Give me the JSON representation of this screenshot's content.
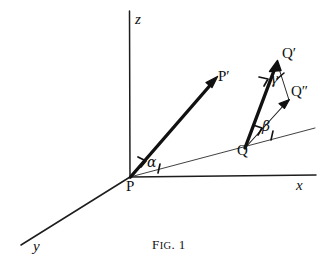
{
  "figure": {
    "caption_prefix": "F",
    "caption_smallcaps": "IG",
    "caption_suffix": ". 1",
    "caption_full": "Fig. 1",
    "background_color": "#ffffff",
    "ink_color": "#111111"
  },
  "axes": [
    {
      "id": "z",
      "label": "z",
      "from": [
        130,
        177
      ],
      "to": [
        129,
        11
      ],
      "weight": "thin"
    },
    {
      "id": "x",
      "label": "x",
      "from": [
        130,
        177
      ],
      "to": [
        316,
        175
      ],
      "weight": "thin"
    },
    {
      "id": "y",
      "label": "y",
      "from": [
        130,
        177
      ],
      "to": [
        21,
        245
      ],
      "weight": "thin"
    }
  ],
  "axis_labels": [
    {
      "id": "z-label",
      "text": "z",
      "x": 135,
      "y": 12
    },
    {
      "id": "x-label",
      "text": "x",
      "x": 296,
      "y": 180
    },
    {
      "id": "y-label",
      "text": "y",
      "x": 33,
      "y": 241
    }
  ],
  "points": [
    {
      "id": "P",
      "text": "P",
      "x": 127,
      "y": 179
    },
    {
      "id": "Pp",
      "text": "P′",
      "x": 219,
      "y": 70
    },
    {
      "id": "Q",
      "text": "Q",
      "x": 238,
      "y": 144
    },
    {
      "id": "Qp",
      "text": "Q′",
      "x": 283,
      "y": 47
    },
    {
      "id": "Qpp",
      "text": "Q″",
      "x": 292,
      "y": 85
    }
  ],
  "angles": [
    {
      "id": "alpha",
      "symbol": "α",
      "x": 148,
      "y": 157,
      "vertex": "P",
      "between": [
        "PP′",
        "ground-ray"
      ]
    },
    {
      "id": "beta",
      "symbol": "β",
      "x": 263,
      "y": 121,
      "vertex": "Q",
      "between": [
        "QQ″",
        "ground-ray"
      ]
    },
    {
      "id": "gamma",
      "symbol": "γ",
      "x": 272,
      "y": 74,
      "vertex": "Q′",
      "between": [
        "QQ′",
        "Q′Q″"
      ]
    }
  ],
  "vectors": [
    {
      "id": "PPprime",
      "label": "P→P′",
      "from": [
        130,
        177
      ],
      "to": [
        216,
        78
      ],
      "weight": "thick"
    },
    {
      "id": "QQprime",
      "label": "Q→Q′",
      "from": [
        245,
        148
      ],
      "to": [
        277,
        62
      ],
      "weight": "thick"
    },
    {
      "id": "QQdoubleprime",
      "label": "Q→Q″",
      "from": [
        245,
        148
      ],
      "to": [
        288,
        101
      ],
      "weight": "thin"
    }
  ],
  "construction_lines": [
    {
      "id": "ground-ray",
      "label": "ray from P through Q",
      "from": [
        130,
        177
      ],
      "to": [
        315,
        128
      ],
      "weight": "thin"
    },
    {
      "id": "Qprime-Qdoubleprime",
      "label": "Q′ to Q″",
      "from": [
        278,
        66
      ],
      "to": [
        289,
        100
      ],
      "weight": "thin"
    }
  ],
  "tick_marks": [
    {
      "id": "alpha-tick",
      "x": 159,
      "y": 170
    },
    {
      "id": "beta-tick",
      "x": 272,
      "y": 136
    }
  ]
}
